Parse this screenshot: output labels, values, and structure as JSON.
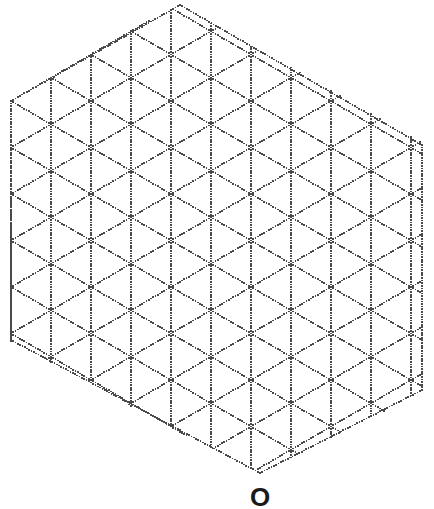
{
  "figure": {
    "type": "isometric-dot-grid",
    "canvas": {
      "width": 434,
      "height": 509
    },
    "background_color": "#ffffff",
    "dot_color": "#4a4a4a",
    "dot_radius_px": 0.85,
    "dot_spacing_px": 2.6,
    "line_style": "dotted"
  },
  "grid": {
    "description": "Triangular/isometric lattice drawn as dotted lines in three directions: vertical, +30 degrees and -30 degrees from horizontal.",
    "cell_width_px": 40,
    "cell_height_px": 46.5,
    "column_step_x_px": 40,
    "row_step_y_px": 46.5,
    "half_row_y_px": 23.25,
    "directions": [
      "vertical",
      "up-right-30deg",
      "down-right-30deg"
    ],
    "origin": {
      "x": 11,
      "y": 101
    },
    "columns": 11,
    "rows": 9
  },
  "boundary": {
    "shape": "irregular-hexagon",
    "vertices": [
      {
        "name": "top",
        "x": 180,
        "y": 5
      },
      {
        "name": "upper-right",
        "x": 422,
        "y": 145
      },
      {
        "name": "lower-right",
        "x": 422,
        "y": 390
      },
      {
        "name": "bottom",
        "x": 260,
        "y": 473
      },
      {
        "name": "lower-left",
        "x": 11,
        "y": 340
      },
      {
        "name": "upper-left",
        "x": 11,
        "y": 101
      }
    ],
    "left_edge_vertical": true,
    "right_edge_vertical": true
  },
  "labels": {
    "bottom_marker": {
      "text": "O",
      "x": 260,
      "y": 497,
      "font_size_px": 26,
      "font_weight": "bold",
      "color": "#1a1a1a"
    }
  },
  "chart_data": {
    "type": "scatter",
    "xlabel": "",
    "ylabel": "",
    "xlim": [
      0,
      434
    ],
    "ylim": [
      0,
      509
    ],
    "grid": true,
    "legend": "none",
    "annotations": [
      {
        "text": "O",
        "x": 260,
        "y": 497
      }
    ],
    "series": [
      {
        "name": "lattice-vertices",
        "note": "Triangular lattice node positions; columns every 40px, rows every 46.5px, odd columns offset 23.25px vertically.",
        "values": []
      }
    ]
  }
}
